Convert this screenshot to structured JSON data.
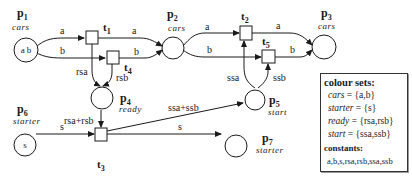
{
  "places": [
    {
      "id": "p1",
      "name": "p",
      "sub": "1",
      "type": "cars",
      "tokens": "a b"
    },
    {
      "id": "p2",
      "name": "p",
      "sub": "2",
      "type": "cars",
      "tokens": ""
    },
    {
      "id": "p3",
      "name": "p",
      "sub": "3",
      "type": "cars",
      "tokens": ""
    },
    {
      "id": "p4",
      "name": "p",
      "sub": "4",
      "type": "ready",
      "tokens": ""
    },
    {
      "id": "p5",
      "name": "p",
      "sub": "5",
      "type": "start",
      "tokens": ""
    },
    {
      "id": "p6",
      "name": "p",
      "sub": "6",
      "type": "starter",
      "tokens": "s"
    },
    {
      "id": "p7",
      "name": "p",
      "sub": "7",
      "type": "starter",
      "tokens": ""
    }
  ],
  "transitions": [
    {
      "id": "t1",
      "name": "t",
      "sub": "1"
    },
    {
      "id": "t2",
      "name": "t",
      "sub": "2"
    },
    {
      "id": "t3",
      "name": "t",
      "sub": "3"
    },
    {
      "id": "t4",
      "name": "t",
      "sub": "4"
    },
    {
      "id": "t5",
      "name": "t",
      "sub": "5"
    }
  ],
  "arcs": {
    "p1_t1": "a",
    "t1_p2": "a",
    "p1_t4": "b",
    "t4_p2": "b",
    "t1_p4": "rsa",
    "t4_p4": "rsb",
    "p4_t3": "rsa+rsb",
    "p6_t3": "s",
    "t3_p7": "s",
    "t3_p5": "ssa+ssb",
    "p2_t2": "a",
    "p2_t5": "b",
    "t2_p3": "a",
    "t5_p3": "b",
    "p5_t2": "ssa",
    "p5_t5": "ssb"
  },
  "legend": {
    "title": "colour sets:",
    "rows": [
      {
        "name": "cars",
        "value": " = {a,b}"
      },
      {
        "name": "starter",
        "value": " = {s}"
      },
      {
        "name": "ready",
        "value": " = {rsa,rsb}"
      },
      {
        "name": "start",
        "value": " = {ssa,ssb}"
      }
    ],
    "constants_title": "constants:",
    "constants": "a,b,s,rsa,rsb,ssa,ssb"
  }
}
